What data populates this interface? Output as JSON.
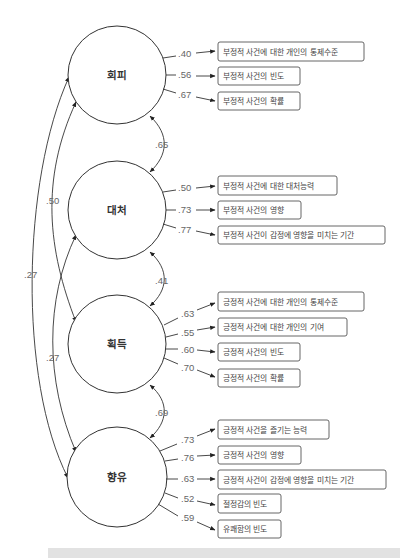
{
  "diagram": {
    "type": "structural-equation-model",
    "factors": [
      {
        "id": "f1",
        "label": "회피",
        "cx": 117,
        "cy": 75,
        "indicators": [
          {
            "loading": ".40",
            "label": "부정적 사건에 대한 개인의 통제수준",
            "y": 42,
            "w": 146
          },
          {
            "loading": ".56",
            "label": "부정적 사건의 빈도",
            "y": 67,
            "w": 82
          },
          {
            "loading": ".67",
            "label": "부정적 사건의 확률",
            "y": 92,
            "w": 82
          }
        ]
      },
      {
        "id": "f2",
        "label": "대처",
        "cx": 117,
        "cy": 210,
        "indicators": [
          {
            "loading": ".50",
            "label": "부정적 사건에 대한 대처능력",
            "y": 176,
            "w": 119
          },
          {
            "loading": ".73",
            "label": "부정적 사건의 영향",
            "y": 201,
            "w": 83
          },
          {
            "loading": ".77",
            "label": "부정적 사건이 감정에 영향을 미치는 기간",
            "y": 226,
            "w": 167
          }
        ]
      },
      {
        "id": "f3",
        "label": "획득",
        "cx": 117,
        "cy": 344,
        "indicators": [
          {
            "loading": ".63",
            "label": "긍정적 사건에 대한 개인의 통제수준",
            "y": 292,
            "w": 146
          },
          {
            "loading": ".55",
            "label": "긍정적 사건에 대한 개인의 기여",
            "y": 318,
            "w": 129
          },
          {
            "loading": ".60",
            "label": "긍정적 사건의 빈도",
            "y": 343,
            "w": 82
          },
          {
            "loading": ".70",
            "label": "긍정적 사건의 확률",
            "y": 369,
            "w": 82
          }
        ]
      },
      {
        "id": "f4",
        "label": "향유",
        "cx": 117,
        "cy": 477,
        "indicators": [
          {
            "loading": ".73",
            "label": "긍정적 사건을 즐기는 능력",
            "y": 420,
            "w": 111
          },
          {
            "loading": ".76",
            "label": "긍정적 사건의 영향",
            "y": 446,
            "w": 83
          },
          {
            "loading": ".63",
            "label": "긍정적 사건이 감정에 영향을 미치는 기간",
            "y": 470,
            "w": 168
          },
          {
            "loading": ".52",
            "label": "절정감의 빈도",
            "y": 494,
            "w": 63
          },
          {
            "loading": ".59",
            "label": "유쾌함의 빈도",
            "y": 520,
            "w": 63
          }
        ]
      }
    ],
    "correlations": [
      {
        "from": "회피",
        "to": "대처",
        "value": ".65"
      },
      {
        "from": "대처",
        "to": "획득",
        "value": ".41"
      },
      {
        "from": "획득",
        "to": "향유",
        "value": ".69"
      },
      {
        "from": "회피",
        "to": "획득",
        "value": ".50"
      },
      {
        "from": "대처",
        "to": "향유",
        "value": ".27"
      },
      {
        "from": "회피",
        "to": "향유",
        "value": ".27"
      }
    ]
  }
}
